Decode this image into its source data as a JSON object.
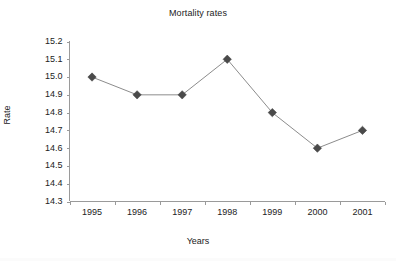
{
  "chart_data": {
    "type": "line",
    "title": "Mortality rates",
    "xlabel": "Years",
    "ylabel": "Rate",
    "categories": [
      "1995",
      "1996",
      "1997",
      "1998",
      "1999",
      "2000",
      "2001"
    ],
    "values": [
      15.0,
      14.9,
      14.9,
      15.1,
      14.8,
      14.6,
      14.7
    ],
    "series": [
      {
        "name": "Rate",
        "values": [
          15.0,
          14.9,
          14.9,
          15.1,
          14.8,
          14.6,
          14.7
        ]
      }
    ],
    "ylim": [
      14.3,
      15.2
    ],
    "ytick_labels": [
      "15.2",
      "15.1",
      "15.0",
      "14.9",
      "14.8",
      "14.7",
      "14.6",
      "14.5",
      "14.4",
      "14.3"
    ],
    "ytick_values": [
      15.2,
      15.1,
      15.0,
      14.9,
      14.8,
      14.7,
      14.6,
      14.5,
      14.4,
      14.3
    ],
    "ytick_step": 0.1,
    "grid": false,
    "legend": false,
    "legend_position": "none",
    "marker": "diamond",
    "colors": {
      "line": "#8c8c8c",
      "marker": "#4a4a4a",
      "axis": "#9a9a9a",
      "text": "#222222",
      "background": "#ffffff"
    }
  }
}
